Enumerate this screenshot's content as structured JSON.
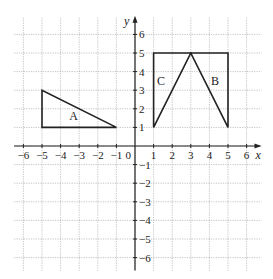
{
  "chart_data": {
    "type": "coordinate-grid",
    "title": "",
    "xlabel": "x",
    "ylabel": "y",
    "xlim": [
      -6.5,
      6.8
    ],
    "ylim": [
      -6.7,
      7
    ],
    "x_ticks": [
      -6,
      -5,
      -4,
      -3,
      -2,
      -1,
      1,
      2,
      3,
      4,
      5,
      6
    ],
    "y_ticks": [
      -6,
      -5,
      -4,
      -3,
      -2,
      -1,
      1,
      2,
      3,
      4,
      5,
      6
    ],
    "origin_label": "0",
    "grid": true,
    "shapes": [
      {
        "name": "A",
        "type": "triangle",
        "vertices": [
          [
            -5,
            1
          ],
          [
            -5,
            3
          ],
          [
            -1,
            1
          ]
        ],
        "label_pos": [
          -3.3,
          1.6
        ]
      },
      {
        "name": "B",
        "type": "triangle",
        "vertices": [
          [
            3,
            5
          ],
          [
            5,
            5
          ],
          [
            5,
            1
          ]
        ],
        "label_pos": [
          4.3,
          3.5
        ]
      },
      {
        "name": "C",
        "type": "triangle",
        "vertices": [
          [
            1,
            1
          ],
          [
            1,
            5
          ],
          [
            3,
            5
          ]
        ],
        "label_pos": [
          1.4,
          3.5
        ]
      }
    ]
  },
  "labels": {
    "x_axis": "x",
    "y_axis": "y",
    "origin": "0"
  }
}
